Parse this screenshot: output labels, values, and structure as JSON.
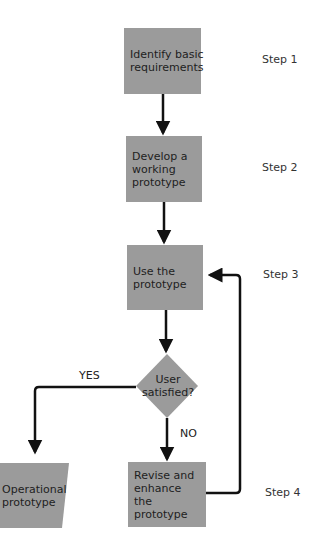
{
  "colors": {
    "box_fill": "#9b9b9b",
    "line": "#111111",
    "background": "#ffffff"
  },
  "nodes": {
    "step1_box": "Identify basic requirements",
    "step2_box": "Develop a working prototype",
    "step3_box": "Use the prototype",
    "decision": "User satisfied?",
    "step4_box": "Revise and enhance the prototype",
    "output": "Operational prototype"
  },
  "steps": [
    "Step 1",
    "Step 2",
    "Step 3",
    "Step 4"
  ],
  "edge_labels": {
    "yes": "YES",
    "no": "NO"
  }
}
